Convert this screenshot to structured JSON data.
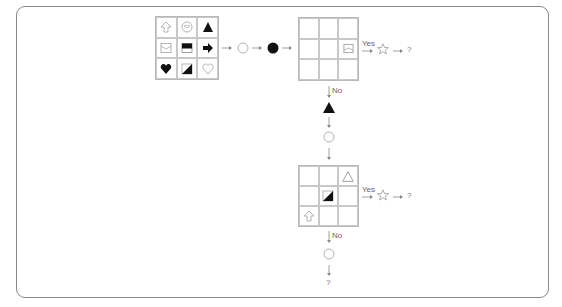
{
  "diagram": {
    "title": "",
    "input_grid": {
      "cells": [
        {
          "icon": "up-arrow-outline"
        },
        {
          "icon": "clock-outline"
        },
        {
          "icon": "triangle-filled"
        },
        {
          "icon": "envelope-outline"
        },
        {
          "icon": "bar-rectangle-filled"
        },
        {
          "icon": "right-arrow-filled"
        },
        {
          "icon": "heart-filled"
        },
        {
          "icon": "diagonal-half-square"
        },
        {
          "icon": "heart-outline"
        }
      ]
    },
    "chain_top": [
      {
        "type": "arrow"
      },
      {
        "type": "circle-hollow"
      },
      {
        "type": "arrow"
      },
      {
        "type": "circle-filled"
      },
      {
        "type": "arrow"
      }
    ],
    "grid_1": {
      "cells": [
        "",
        "",
        "",
        "",
        "",
        "envelope-outline",
        "",
        "",
        ""
      ]
    },
    "branch_1": {
      "yes_label": "Yes",
      "yes_result_icon": "star-outline",
      "yes_result_text": "?",
      "no_label": "No"
    },
    "chain_middle": [
      {
        "type": "triangle-filled"
      },
      {
        "type": "arrow-down"
      },
      {
        "type": "circle-hollow"
      },
      {
        "type": "arrow-down"
      }
    ],
    "grid_2": {
      "cells": [
        "",
        "",
        "triangle-outline",
        "",
        "diagonal-half-square",
        "",
        "up-arrow-outline",
        "",
        ""
      ]
    },
    "branch_2": {
      "yes_label": "Yes",
      "yes_result_icon": "star-outline",
      "yes_result_text": "?",
      "no_label": "No"
    },
    "chain_bottom": [
      {
        "type": "circle-hollow"
      },
      {
        "type": "arrow-down"
      }
    ],
    "final_text": "?",
    "colors": {
      "border": "#8a8a8a",
      "grid_line": "#c8c8c8",
      "filled": "#111111",
      "outline": "#aaaaaa"
    }
  }
}
